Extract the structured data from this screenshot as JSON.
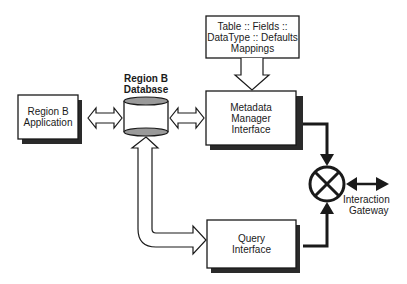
{
  "diagram": {
    "nodes": {
      "app": {
        "line1": "Region B",
        "line2": "Application"
      },
      "database": {
        "line1": "Region B",
        "line2": "Database"
      },
      "mappings": {
        "line1": "Table :: Fields ::",
        "line2": "DataType :: Defaults",
        "line3": "Mappings"
      },
      "metadata": {
        "line1": "Metadata",
        "line2": "Manager",
        "line3": "Interface"
      },
      "query": {
        "line1": "Query",
        "line2": "Interface"
      },
      "gateway": {
        "line1": "Interaction",
        "line2": "Gateway"
      }
    },
    "edges": [
      {
        "from": "app",
        "to": "database",
        "type": "double-hollow-arrow"
      },
      {
        "from": "database",
        "to": "metadata",
        "type": "double-hollow-arrow"
      },
      {
        "from": "mappings",
        "to": "metadata",
        "type": "hollow-arrow"
      },
      {
        "from": "database",
        "to": "query",
        "type": "double-hollow-arrow"
      },
      {
        "from": "metadata",
        "to": "gateway",
        "type": "solid-arrow"
      },
      {
        "from": "query",
        "to": "gateway",
        "type": "solid-arrow"
      },
      {
        "from": "gateway",
        "to": "external",
        "type": "double-solid-arrow"
      }
    ],
    "colors": {
      "stroke": "#1a1a1a",
      "shadow": "#2a2a2a",
      "cylinder_cap": "#9a9a9a"
    }
  }
}
